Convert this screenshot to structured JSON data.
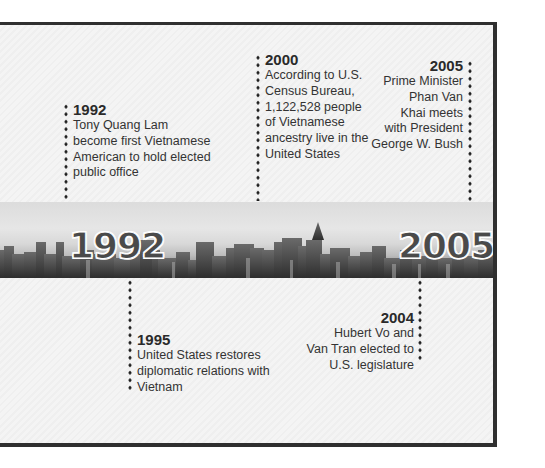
{
  "timeline": {
    "band": {
      "start_year": "1992",
      "end_year": "2005",
      "image": "city-skyline-grayscale"
    },
    "events_above": [
      {
        "year": "1992",
        "lines": [
          "Tony Quang Lam",
          "become first Vietnamese",
          "American to hold elected",
          "public office"
        ],
        "text": "Tony Quang Lam become first Vietnamese American to hold elected public office"
      },
      {
        "year": "2000",
        "lines": [
          "According to U.S.",
          "Census Bureau,",
          "1,122,528 people",
          "of Vietnamese",
          "ancestry live in the",
          "United States"
        ],
        "text": "According to U.S. Census Bureau, 1,122,528 people of Vietnamese ancestry live in the United States"
      },
      {
        "year": "2005",
        "lines": [
          "Prime Minister",
          "Phan Van",
          "Khai meets",
          "with President",
          "George W. Bush"
        ],
        "text": "Prime Minister Phan Van Khai meets with President George W. Bush"
      }
    ],
    "events_below": [
      {
        "year": "1995",
        "lines": [
          "United States restores",
          "diplomatic relations with",
          "Vietnam"
        ],
        "text": "United States restores diplomatic relations with Vietnam"
      },
      {
        "year": "2004",
        "lines": [
          "Hubert Vo and",
          "Van Tran elected to",
          "U.S. legislature"
        ],
        "text": "Hubert Vo and Van Tran elected to U.S. legislature"
      }
    ]
  },
  "colors": {
    "frame_border": "#2f2f2f",
    "background": "#f2f2f2",
    "text": "#333333",
    "dots": "#1e1e1e"
  }
}
